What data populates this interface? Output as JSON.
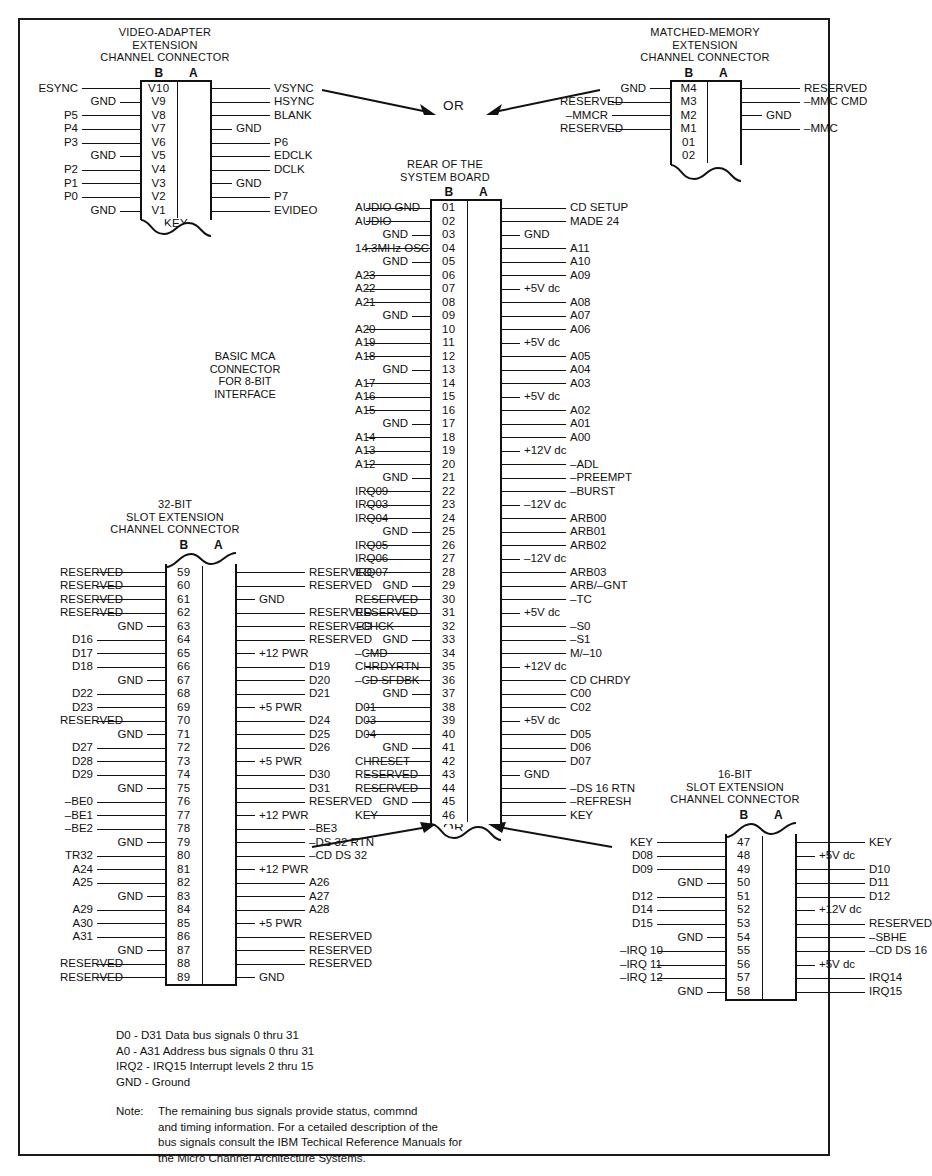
{
  "figure": {
    "or_top": "OR",
    "or_bottom": "OR",
    "basic_caption": "BASIC MCA\nCONNECTOR\nFOR 8-BIT\nINTERFACE",
    "column_b": "B",
    "column_a": "A"
  },
  "video_connector": {
    "title": "VIDEO-ADAPTER\nEXTENSION\nCHANNEL CONNECTOR",
    "key_label": "KEY",
    "rows": [
      {
        "left": "ESYNC",
        "num": "V10",
        "right": "VSYNC"
      },
      {
        "left": "GND",
        "num": "V9",
        "right": "HSYNC"
      },
      {
        "left": "P5",
        "num": "V8",
        "right": "BLANK"
      },
      {
        "left": "P4",
        "num": "V7",
        "right": "GND"
      },
      {
        "left": "P3",
        "num": "V6",
        "right": "P6"
      },
      {
        "left": "GND",
        "num": "V5",
        "right": "EDCLK"
      },
      {
        "left": "P2",
        "num": "V4",
        "right": "DCLK"
      },
      {
        "left": "P1",
        "num": "V3",
        "right": "GND"
      },
      {
        "left": "P0",
        "num": "V2",
        "right": "P7"
      },
      {
        "left": "GND",
        "num": "V1",
        "right": "EVIDEO"
      }
    ]
  },
  "matched_memory_connector": {
    "title": "MATCHED-MEMORY\nEXTENSION\nCHANNEL CONNECTOR",
    "rows": [
      {
        "left": "GND",
        "num": "M4",
        "right": "RESERVED"
      },
      {
        "left": "RESERVED",
        "num": "M3",
        "right": "–MMC CMD"
      },
      {
        "left": "–MMCR",
        "num": "M2",
        "right": "GND"
      },
      {
        "left": "RESERVED",
        "num": "M1",
        "right": "–MMC"
      },
      {
        "left": "",
        "num": "01",
        "right": ""
      },
      {
        "left": "",
        "num": "02",
        "right": ""
      }
    ]
  },
  "system_board_connector": {
    "title": "REAR OF THE\nSYSTEM BOARD",
    "rows": [
      {
        "left": "AUDIO GND",
        "num": "01",
        "right": "CD SETUP"
      },
      {
        "left": "AUDIO",
        "num": "02",
        "right": "MADE 24"
      },
      {
        "left": "GND",
        "num": "03",
        "right": "GND"
      },
      {
        "left": "14.3MHz OSC",
        "num": "04",
        "right": "A11"
      },
      {
        "left": "GND",
        "num": "05",
        "right": "A10"
      },
      {
        "left": "A23",
        "num": "06",
        "right": "A09"
      },
      {
        "left": "A22",
        "num": "07",
        "right": "+5V dc"
      },
      {
        "left": "A21",
        "num": "08",
        "right": "A08"
      },
      {
        "left": "GND",
        "num": "09",
        "right": "A07"
      },
      {
        "left": "A20",
        "num": "10",
        "right": "A06"
      },
      {
        "left": "A19",
        "num": "11",
        "right": "+5V dc"
      },
      {
        "left": "A18",
        "num": "12",
        "right": "A05"
      },
      {
        "left": "GND",
        "num": "13",
        "right": "A04"
      },
      {
        "left": "A17",
        "num": "14",
        "right": "A03"
      },
      {
        "left": "A16",
        "num": "15",
        "right": "+5V dc"
      },
      {
        "left": "A15",
        "num": "16",
        "right": "A02"
      },
      {
        "left": "GND",
        "num": "17",
        "right": "A01"
      },
      {
        "left": "A14",
        "num": "18",
        "right": "A00"
      },
      {
        "left": "A13",
        "num": "19",
        "right": "+12V dc"
      },
      {
        "left": "A12",
        "num": "20",
        "right": "–ADL"
      },
      {
        "left": "GND",
        "num": "21",
        "right": "–PREEMPT"
      },
      {
        "left": "IRQ09",
        "num": "22",
        "right": "–BURST"
      },
      {
        "left": "IRQ03",
        "num": "23",
        "right": "–12V dc"
      },
      {
        "left": "IRQ04",
        "num": "24",
        "right": "ARB00"
      },
      {
        "left": "GND",
        "num": "25",
        "right": "ARB01"
      },
      {
        "left": "IRQ05",
        "num": "26",
        "right": "ARB02"
      },
      {
        "left": "IRQ06",
        "num": "27",
        "right": "–12V dc"
      },
      {
        "left": "IRQ07",
        "num": "28",
        "right": "ARB03"
      },
      {
        "left": "GND",
        "num": "29",
        "right": "ARB/–GNT"
      },
      {
        "left": "RESERVED",
        "num": "30",
        "right": "–TC"
      },
      {
        "left": "RESERVED",
        "num": "31",
        "right": "+5V dc"
      },
      {
        "left": "–CHCK",
        "num": "32",
        "right": "–S0"
      },
      {
        "left": "GND",
        "num": "33",
        "right": "–S1"
      },
      {
        "left": "–CMD",
        "num": "34",
        "right": "M/–10"
      },
      {
        "left": "CHRDYRTN",
        "num": "35",
        "right": "+12V dc"
      },
      {
        "left": "–CD SFDBK",
        "num": "36",
        "right": "CD CHRDY"
      },
      {
        "left": "GND",
        "num": "37",
        "right": "C00"
      },
      {
        "left": "D01",
        "num": "38",
        "right": "C02"
      },
      {
        "left": "D03",
        "num": "39",
        "right": "+5V dc"
      },
      {
        "left": "D04",
        "num": "40",
        "right": "D05"
      },
      {
        "left": "GND",
        "num": "41",
        "right": "D06"
      },
      {
        "left": "CHRESET",
        "num": "42",
        "right": "D07"
      },
      {
        "left": "RESERVED",
        "num": "43",
        "right": "GND"
      },
      {
        "left": "RESERVED",
        "num": "44",
        "right": "–DS 16 RTN"
      },
      {
        "left": "GND",
        "num": "45",
        "right": "–REFRESH"
      },
      {
        "left": "KEY",
        "num": "46",
        "right": "KEY"
      }
    ]
  },
  "slot32_connector": {
    "title": "32-BIT\nSLOT EXTENSION\nCHANNEL CONNECTOR",
    "rows": [
      {
        "left": "RESERVED",
        "num": "59",
        "right": "RESERVED"
      },
      {
        "left": "RESERVED",
        "num": "60",
        "right": "RESERVED"
      },
      {
        "left": "RESERVED",
        "num": "61",
        "right": "GND"
      },
      {
        "left": "RESERVED",
        "num": "62",
        "right": "RESERVED"
      },
      {
        "left": "GND",
        "num": "63",
        "right": "RESERVED"
      },
      {
        "left": "D16",
        "num": "64",
        "right": "RESERVED"
      },
      {
        "left": "D17",
        "num": "65",
        "right": "+12 PWR"
      },
      {
        "left": "D18",
        "num": "66",
        "right": "D19"
      },
      {
        "left": "GND",
        "num": "67",
        "right": "D20"
      },
      {
        "left": "D22",
        "num": "68",
        "right": "D21"
      },
      {
        "left": "D23",
        "num": "69",
        "right": "+5 PWR"
      },
      {
        "left": "RESERVED",
        "num": "70",
        "right": "D24"
      },
      {
        "left": "GND",
        "num": "71",
        "right": "D25"
      },
      {
        "left": "D27",
        "num": "72",
        "right": "D26"
      },
      {
        "left": "D28",
        "num": "73",
        "right": "+5 PWR"
      },
      {
        "left": "D29",
        "num": "74",
        "right": "D30"
      },
      {
        "left": "GND",
        "num": "75",
        "right": "D31"
      },
      {
        "left": "–BE0",
        "num": "76",
        "right": "RESERVED"
      },
      {
        "left": "–BE1",
        "num": "77",
        "right": "+12 PWR"
      },
      {
        "left": "–BE2",
        "num": "78",
        "right": "–BE3"
      },
      {
        "left": "GND",
        "num": "79",
        "right": "–DS 32 RTN"
      },
      {
        "left": "TR32",
        "num": "80",
        "right": "–CD DS 32"
      },
      {
        "left": "A24",
        "num": "81",
        "right": "+12 PWR"
      },
      {
        "left": "A25",
        "num": "82",
        "right": "A26"
      },
      {
        "left": "GND",
        "num": "83",
        "right": "A27"
      },
      {
        "left": "A29",
        "num": "84",
        "right": "A28"
      },
      {
        "left": "A30",
        "num": "85",
        "right": "+5 PWR"
      },
      {
        "left": "A31",
        "num": "86",
        "right": "RESERVED"
      },
      {
        "left": "GND",
        "num": "87",
        "right": "RESERVED"
      },
      {
        "left": "RESERVED",
        "num": "88",
        "right": "RESERVED"
      },
      {
        "left": "RESERVED",
        "num": "89",
        "right": "GND"
      }
    ]
  },
  "slot16_connector": {
    "title": "16-BIT\nSLOT EXTENSION\nCHANNEL CONNECTOR",
    "rows": [
      {
        "left": "KEY",
        "num": "47",
        "right": "KEY"
      },
      {
        "left": "D08",
        "num": "48",
        "right": "+5V dc"
      },
      {
        "left": "D09",
        "num": "49",
        "right": "D10"
      },
      {
        "left": "GND",
        "num": "50",
        "right": "D11"
      },
      {
        "left": "D12",
        "num": "51",
        "right": "D12"
      },
      {
        "left": "D14",
        "num": "52",
        "right": "+12V dc"
      },
      {
        "left": "D15",
        "num": "53",
        "right": "RESERVED"
      },
      {
        "left": "GND",
        "num": "54",
        "right": "–SBHE"
      },
      {
        "left": "–IRQ 10",
        "num": "55",
        "right": "–CD DS 16"
      },
      {
        "left": "–IRQ 11",
        "num": "56",
        "right": "+5V dc"
      },
      {
        "left": "–IRQ 12",
        "num": "57",
        "right": "IRQ14"
      },
      {
        "left": "GND",
        "num": "58",
        "right": "IRQ15"
      }
    ]
  },
  "legend": {
    "lines": "D0 - D31 Data bus signals 0 thru 31\nA0 - A31 Address bus signals 0 thru 31\nIRQ2 - IRQ15 Interrupt levels 2 thru 15\nGND - Ground"
  },
  "note": {
    "label": "Note:",
    "text": "The remaining bus signals provide status, commnd\nand timing information.  For a cetailed description of the\nbus signals consult the IBM Techical Reference Manuals for\nthe  Micro Channel Architecture Systems."
  }
}
